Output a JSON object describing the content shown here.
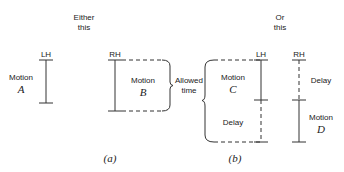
{
  "headings": {
    "a_line1": "Either",
    "a_line2": "this",
    "b_line1": "Or",
    "b_line2": "this"
  },
  "hands": {
    "lh_a": "LH",
    "rh_a": "RH",
    "lh_b": "LH",
    "rh_b": "RH"
  },
  "motions": {
    "a": {
      "label": "Motion",
      "letter": "A"
    },
    "b": {
      "label": "Motion",
      "letter": "B"
    },
    "c": {
      "label": "Motion",
      "letter": "C"
    },
    "d": {
      "label": "Motion",
      "letter": "D"
    }
  },
  "delays": {
    "c_delay": "Delay",
    "d_delay": "Delay"
  },
  "allowed_time": {
    "line1": "Allowed",
    "line2": "time"
  },
  "captions": {
    "a": "(a)",
    "b": "(b)"
  }
}
